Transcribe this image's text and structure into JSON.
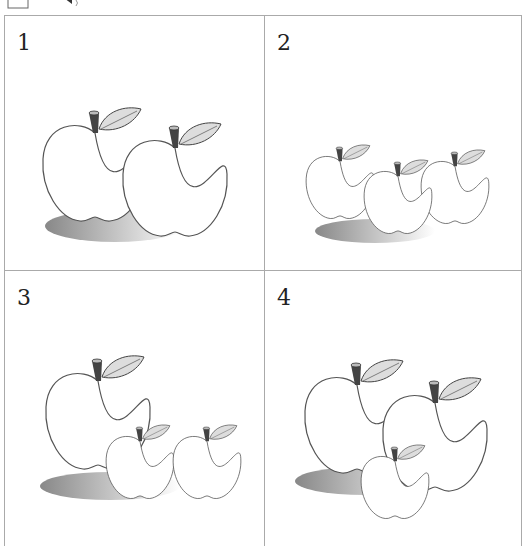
{
  "header": {
    "icons": [
      "box-icon",
      "speaker-icon"
    ]
  },
  "panels": [
    {
      "label": "1",
      "description": "Two large apples"
    },
    {
      "label": "2",
      "description": "Three small apples"
    },
    {
      "label": "3",
      "description": "One large apple and two small apples"
    },
    {
      "label": "4",
      "description": "Two large apples and one small apple"
    }
  ]
}
